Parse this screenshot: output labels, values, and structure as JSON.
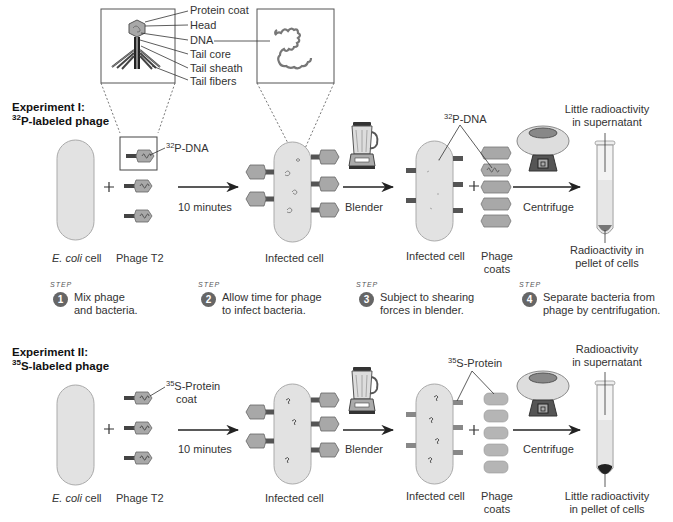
{
  "inset": {
    "phage_labels": [
      "Protein coat",
      "Head",
      "DNA",
      "Tail core",
      "Tail sheath",
      "Tail fibers"
    ]
  },
  "experiment1": {
    "title_line1": "Experiment I:",
    "title_isotope": "32",
    "title_rest": "P-labeled phage",
    "label_isotope": "32",
    "label_text": "P-DNA",
    "ecoli_italic": "E. coli",
    "ecoli_rest": " cell",
    "phage": "Phage T2",
    "arrow1": "10 minutes",
    "infected1": "Infected cell",
    "arrow2": "Blender",
    "infected2": "Infected cell",
    "coats_line1": "Phage",
    "coats_line2": "coats",
    "arrow3": "Centrifuge",
    "top_isotope": "32",
    "top_label": "P-DNA",
    "supernatant_line1": "Little radioactivity",
    "supernatant_line2": "in supernatant",
    "pellet_line1": "Radioactivity in",
    "pellet_line2": "pellet of cells"
  },
  "steps": [
    {
      "word": "STEP",
      "num": "1",
      "line1": "Mix phage",
      "line2": "and bacteria."
    },
    {
      "word": "STEP",
      "num": "2",
      "line1": "Allow time for phage",
      "line2": "to infect bacteria."
    },
    {
      "word": "STEP",
      "num": "3",
      "line1": "Subject to shearing",
      "line2": "forces in blender."
    },
    {
      "word": "STEP",
      "num": "4",
      "line1": "Separate bacteria from",
      "line2": "phage by centrifugation."
    }
  ],
  "experiment2": {
    "title_line1": "Experiment II:",
    "title_isotope": "35",
    "title_rest": "S-labeled phage",
    "label_isotope": "35",
    "label_text": "S-Protein",
    "label_line2": "coat",
    "ecoli_italic": "E. coli",
    "ecoli_rest": " cell",
    "phage": "Phage T2",
    "arrow1": "10 minutes",
    "infected1": "Infected cell",
    "arrow2": "Blender",
    "infected2": "Infected cell",
    "coats_line1": "Phage",
    "coats_line2": "coats",
    "arrow3": "Centrifuge",
    "top_isotope": "35",
    "top_label": "S-Protein",
    "supernatant_line1": "Radioactivity",
    "supernatant_line2": "in supernatant",
    "pellet_line1": "Little radioactivity",
    "pellet_line2": "in pellet of cells"
  },
  "colors": {
    "cell_fill": "#e2e2e2",
    "cell_stroke": "#aaaaaa",
    "phage_fill": "#a8a8a8",
    "dark": "#444444",
    "step_circle": "#666666"
  }
}
